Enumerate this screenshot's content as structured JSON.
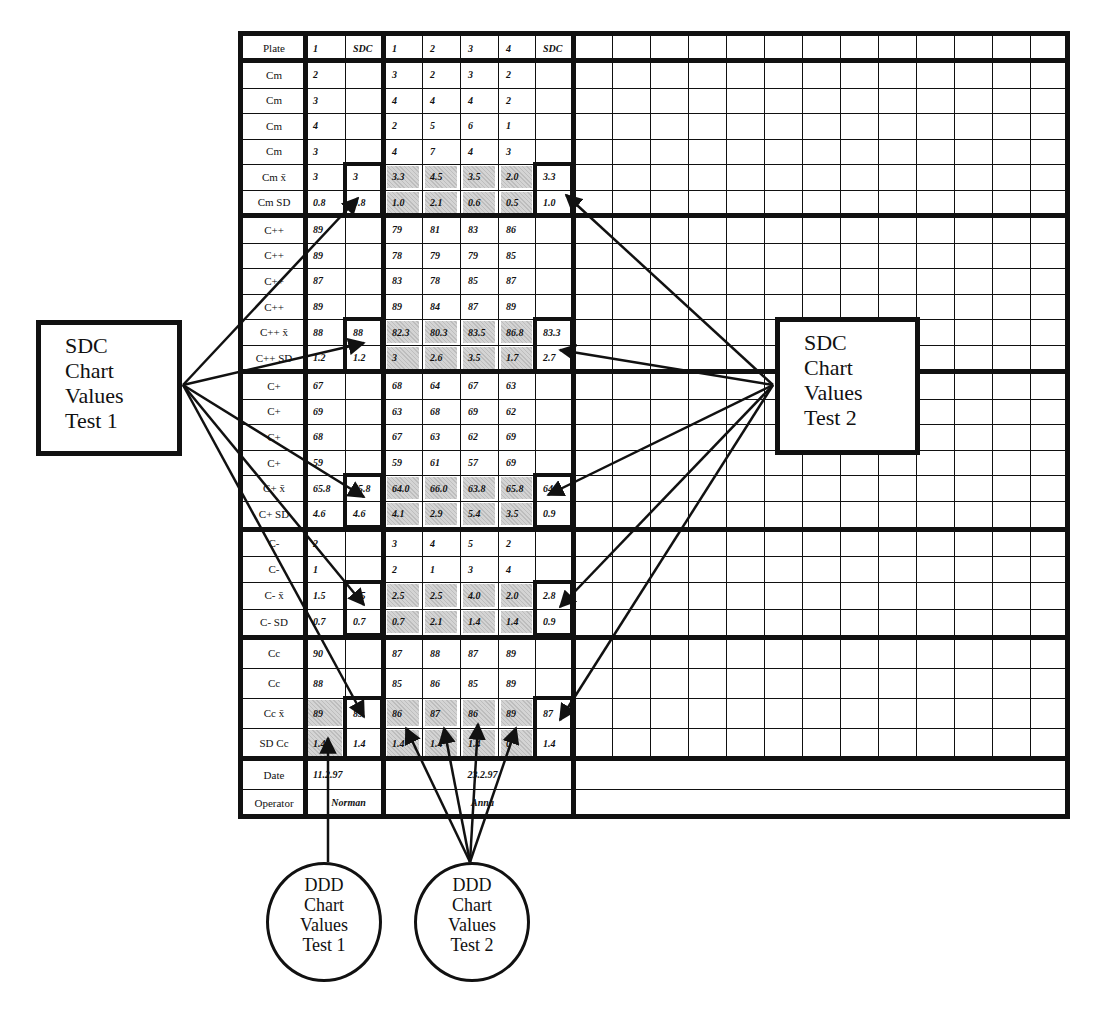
{
  "table": {
    "header": {
      "label": "Plate",
      "test1_cols": [
        "1",
        "SDC"
      ],
      "test2_cols": [
        "1",
        "2",
        "3",
        "4",
        "SDC"
      ]
    },
    "rows": [
      {
        "label": "Cm",
        "t1": "2",
        "t1_sdc": "",
        "t2": [
          "3",
          "2",
          "3",
          "2"
        ],
        "t2_sdc": "",
        "shaded": false
      },
      {
        "label": "Cm",
        "t1": "3",
        "t1_sdc": "",
        "t2": [
          "4",
          "4",
          "4",
          "2"
        ],
        "t2_sdc": "",
        "shaded": false
      },
      {
        "label": "Cm",
        "t1": "4",
        "t1_sdc": "",
        "t2": [
          "2",
          "5",
          "6",
          "1"
        ],
        "t2_sdc": "",
        "shaded": false
      },
      {
        "label": "Cm",
        "t1": "3",
        "t1_sdc": "",
        "t2": [
          "4",
          "7",
          "4",
          "3"
        ],
        "t2_sdc": "",
        "shaded": false
      },
      {
        "label": "Cm x̄",
        "t1": "3",
        "t1_sdc": "3",
        "t2": [
          "3.3",
          "4.5",
          "3.5",
          "2.0"
        ],
        "t2_sdc": "3.3",
        "shaded": true
      },
      {
        "label": "Cm SD",
        "t1": "0.8",
        "t1_sdc": "0.8",
        "t2": [
          "1.0",
          "2.1",
          "0.6",
          "0.5"
        ],
        "t2_sdc": "1.0",
        "shaded": true
      },
      {
        "label": "C++",
        "t1": "89",
        "t1_sdc": "",
        "t2": [
          "79",
          "81",
          "83",
          "86"
        ],
        "t2_sdc": "",
        "shaded": false
      },
      {
        "label": "C++",
        "t1": "89",
        "t1_sdc": "",
        "t2": [
          "78",
          "79",
          "79",
          "85"
        ],
        "t2_sdc": "",
        "shaded": false
      },
      {
        "label": "C++",
        "t1": "87",
        "t1_sdc": "",
        "t2": [
          "83",
          "78",
          "85",
          "87"
        ],
        "t2_sdc": "",
        "shaded": false
      },
      {
        "label": "C++",
        "t1": "89",
        "t1_sdc": "",
        "t2": [
          "89",
          "84",
          "87",
          "89"
        ],
        "t2_sdc": "",
        "shaded": false
      },
      {
        "label": "C++ x̄",
        "t1": "88",
        "t1_sdc": "88",
        "t2": [
          "82.3",
          "80.3",
          "83.5",
          "86.8"
        ],
        "t2_sdc": "83.3",
        "shaded": true
      },
      {
        "label": "C++ SD",
        "t1": "1.2",
        "t1_sdc": "1.2",
        "t2": [
          "3",
          "2.6",
          "3.5",
          "1.7"
        ],
        "t2_sdc": "2.7",
        "shaded": true
      },
      {
        "label": "C+",
        "t1": "67",
        "t1_sdc": "",
        "t2": [
          "68",
          "64",
          "67",
          "63"
        ],
        "t2_sdc": "",
        "shaded": false
      },
      {
        "label": "C+",
        "t1": "69",
        "t1_sdc": "",
        "t2": [
          "63",
          "68",
          "69",
          "62"
        ],
        "t2_sdc": "",
        "shaded": false
      },
      {
        "label": "C+",
        "t1": "68",
        "t1_sdc": "",
        "t2": [
          "67",
          "63",
          "62",
          "69"
        ],
        "t2_sdc": "",
        "shaded": false
      },
      {
        "label": "C+",
        "t1": "59",
        "t1_sdc": "",
        "t2": [
          "59",
          "61",
          "57",
          "69"
        ],
        "t2_sdc": "",
        "shaded": false
      },
      {
        "label": "C+ x̄",
        "t1": "65.8",
        "t1_sdc": "65.8",
        "t2": [
          "64.0",
          "66.0",
          "63.8",
          "65.8"
        ],
        "t2_sdc": "64.4",
        "shaded": true
      },
      {
        "label": "C+ SD",
        "t1": "4.6",
        "t1_sdc": "4.6",
        "t2": [
          "4.1",
          "2.9",
          "5.4",
          "3.5"
        ],
        "t2_sdc": "0.9",
        "shaded": true
      },
      {
        "label": "C-",
        "t1": "2",
        "t1_sdc": "",
        "t2": [
          "3",
          "4",
          "5",
          "2"
        ],
        "t2_sdc": "",
        "shaded": false
      },
      {
        "label": "C-",
        "t1": "1",
        "t1_sdc": "",
        "t2": [
          "2",
          "1",
          "3",
          "4"
        ],
        "t2_sdc": "",
        "shaded": false
      },
      {
        "label": "C- x̄",
        "t1": "1.5",
        "t1_sdc": "1.5",
        "t2": [
          "2.5",
          "2.5",
          "4.0",
          "2.0"
        ],
        "t2_sdc": "2.8",
        "shaded": true
      },
      {
        "label": "C- SD",
        "t1": "0.7",
        "t1_sdc": "0.7",
        "t2": [
          "0.7",
          "2.1",
          "1.4",
          "1.4"
        ],
        "t2_sdc": "0.9",
        "shaded": true
      },
      {
        "label": "Cc",
        "t1": "90",
        "t1_sdc": "",
        "t2": [
          "87",
          "88",
          "87",
          "89"
        ],
        "t2_sdc": "",
        "shaded": false
      },
      {
        "label": "Cc",
        "t1": "88",
        "t1_sdc": "",
        "t2": [
          "85",
          "86",
          "85",
          "89"
        ],
        "t2_sdc": "",
        "shaded": false
      },
      {
        "label": "Cc x̄",
        "t1": "89",
        "t1_sdc": "89",
        "t2": [
          "86",
          "87",
          "86",
          "89"
        ],
        "t2_sdc": "87",
        "shaded": true
      },
      {
        "label": "SD Cc",
        "t1": "1.4",
        "t1_sdc": "1.4",
        "t2": [
          "1.4",
          "1.4",
          "1.4",
          "0"
        ],
        "t2_sdc": "1.4",
        "shaded": true
      }
    ],
    "footer": {
      "date_label": "Date",
      "date_t1": "11.2.97",
      "date_t2": "23.2.97",
      "operator_label": "Operator",
      "operator_t1": "Norman",
      "operator_t2": "Anna"
    }
  },
  "callouts": {
    "sdc_test1": [
      "SDC",
      "Chart",
      "Values",
      "Test 1"
    ],
    "sdc_test2": [
      "SDC",
      "Chart",
      "Values",
      "Test 2"
    ],
    "ddd_test1": [
      "DDD",
      "Chart",
      "Values",
      "Test 1"
    ],
    "ddd_test2": [
      "DDD",
      "Chart",
      "Values",
      "Test 2"
    ]
  }
}
